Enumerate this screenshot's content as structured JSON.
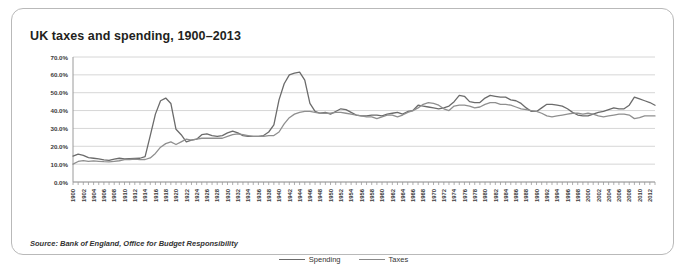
{
  "title": "UK taxes and spending, 1900–2013",
  "source": "Source: Bank of England, Office for Budget Responsibility",
  "legend": {
    "spending": "Spending",
    "taxes": "Taxes"
  },
  "colors": {
    "spending": "#6b6b6b",
    "taxes": "#8f8f8f",
    "grid": "#d6d6d6",
    "axis": "#9a9a9a",
    "border": "#b9b9b9",
    "title": "#231f20"
  },
  "chart_data": {
    "type": "line",
    "title": "UK taxes and spending, 1900–2013",
    "xlabel": "",
    "ylabel": "",
    "ylim": [
      0,
      70
    ],
    "ytick_labels": [
      "0.0%",
      "10.0%",
      "20.0%",
      "30.0%",
      "40.0%",
      "50.0%",
      "60.0%",
      "70.0%"
    ],
    "yticks": [
      0,
      10,
      20,
      30,
      40,
      50,
      60,
      70
    ],
    "grid": true,
    "legend_position": "bottom-center",
    "x_tick_step": 2,
    "x_tick_labels": [
      "1900",
      "1902",
      "1904",
      "1906",
      "1908",
      "1910",
      "1912",
      "1914",
      "1916",
      "1918",
      "1920",
      "1922",
      "1924",
      "1926",
      "1928",
      "1930",
      "1932",
      "1934",
      "1936",
      "1938",
      "1940",
      "1942",
      "1944",
      "1946",
      "1948",
      "1950",
      "1952",
      "1954",
      "1956",
      "1958",
      "1960",
      "1962",
      "1964",
      "1966",
      "1968",
      "1970",
      "1972",
      "1974",
      "1976",
      "1978",
      "1980",
      "1982",
      "1984",
      "1986",
      "1988",
      "1990",
      "1992",
      "1994",
      "1996",
      "1998",
      "2000",
      "2002",
      "2004",
      "2006",
      "2008",
      "2010",
      "2012"
    ],
    "x": [
      1900,
      1901,
      1902,
      1903,
      1904,
      1905,
      1906,
      1907,
      1908,
      1909,
      1910,
      1911,
      1912,
      1913,
      1914,
      1915,
      1916,
      1917,
      1918,
      1919,
      1920,
      1921,
      1922,
      1923,
      1924,
      1925,
      1926,
      1927,
      1928,
      1929,
      1930,
      1931,
      1932,
      1933,
      1934,
      1935,
      1936,
      1937,
      1938,
      1939,
      1940,
      1941,
      1942,
      1943,
      1944,
      1945,
      1946,
      1947,
      1948,
      1949,
      1950,
      1951,
      1952,
      1953,
      1954,
      1955,
      1956,
      1957,
      1958,
      1959,
      1960,
      1961,
      1962,
      1963,
      1964,
      1965,
      1966,
      1967,
      1968,
      1969,
      1970,
      1971,
      1972,
      1973,
      1974,
      1975,
      1976,
      1977,
      1978,
      1979,
      1980,
      1981,
      1982,
      1983,
      1984,
      1985,
      1986,
      1987,
      1988,
      1989,
      1990,
      1991,
      1992,
      1993,
      1994,
      1995,
      1996,
      1997,
      1998,
      1999,
      2000,
      2001,
      2002,
      2003,
      2004,
      2005,
      2006,
      2007,
      2008,
      2009,
      2010,
      2011,
      2012,
      2013
    ],
    "series": [
      {
        "name": "Spending",
        "values": [
          14.5,
          15.6,
          14.9,
          13.6,
          13.3,
          12.9,
          12.4,
          12.1,
          12.8,
          13.3,
          13.0,
          13.1,
          13.2,
          13.3,
          14.2,
          26.0,
          38.0,
          45.5,
          47.0,
          44.0,
          29.5,
          26.5,
          22.5,
          23.5,
          24.0,
          26.5,
          27.0,
          26.0,
          25.5,
          26.0,
          27.5,
          28.5,
          27.5,
          26.0,
          25.5,
          25.5,
          25.5,
          26.0,
          28.0,
          32.0,
          46.0,
          55.0,
          60.0,
          61.0,
          61.5,
          57.0,
          44.0,
          39.5,
          38.5,
          39.0,
          38.0,
          39.5,
          41.0,
          40.5,
          39.0,
          37.5,
          37.0,
          37.0,
          37.5,
          37.5,
          37.0,
          38.0,
          38.5,
          39.0,
          38.0,
          39.5,
          40.0,
          43.0,
          42.5,
          42.0,
          41.5,
          41.0,
          41.5,
          42.5,
          45.0,
          48.5,
          48.0,
          45.0,
          44.5,
          44.5,
          47.0,
          48.5,
          48.0,
          47.5,
          47.5,
          46.0,
          45.5,
          44.0,
          41.5,
          39.5,
          39.5,
          41.5,
          43.5,
          43.5,
          43.0,
          42.5,
          41.0,
          39.0,
          37.5,
          37.0,
          37.0,
          38.0,
          39.0,
          39.5,
          40.5,
          41.5,
          41.0,
          41.0,
          43.0,
          47.5,
          46.5,
          45.5,
          44.5,
          43.0
        ]
      },
      {
        "name": "Taxes",
        "values": [
          10.0,
          11.5,
          12.0,
          11.5,
          11.8,
          11.6,
          11.4,
          11.3,
          11.6,
          11.9,
          12.5,
          12.6,
          12.8,
          12.5,
          12.6,
          13.5,
          16.0,
          19.5,
          21.5,
          22.5,
          21.0,
          22.5,
          24.0,
          23.5,
          24.0,
          24.5,
          24.5,
          24.5,
          24.5,
          24.5,
          25.5,
          26.5,
          27.0,
          26.5,
          26.0,
          25.5,
          25.5,
          25.5,
          26.0,
          26.0,
          28.0,
          32.5,
          36.0,
          38.0,
          39.0,
          39.5,
          39.5,
          39.0,
          38.5,
          38.5,
          38.5,
          39.0,
          39.0,
          38.5,
          38.0,
          37.5,
          37.0,
          36.5,
          36.5,
          35.5,
          36.5,
          37.5,
          37.5,
          36.5,
          37.5,
          39.0,
          40.0,
          41.5,
          43.5,
          44.5,
          44.0,
          43.0,
          41.0,
          40.0,
          42.5,
          43.0,
          43.0,
          42.5,
          41.5,
          42.0,
          43.5,
          44.5,
          44.5,
          43.5,
          43.5,
          43.0,
          42.0,
          41.0,
          40.5,
          40.0,
          39.5,
          38.5,
          37.0,
          36.5,
          37.0,
          37.5,
          38.0,
          38.5,
          38.5,
          38.0,
          38.5,
          38.0,
          37.0,
          36.5,
          37.0,
          37.5,
          38.0,
          38.0,
          37.5,
          35.5,
          36.0,
          37.0,
          37.0,
          37.0
        ]
      }
    ]
  }
}
